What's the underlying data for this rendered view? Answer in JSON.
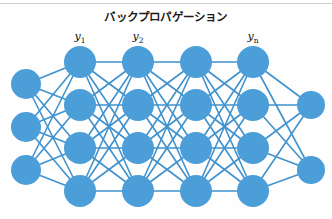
{
  "figure": {
    "title": "バックプロパゲーション",
    "background_color": "#fefefe",
    "rule_color": "#cfcfcf"
  },
  "colors": {
    "node_fill": "#4b9ed8",
    "node_fill_light": "#5aa9de",
    "edge": "#3f92ce",
    "text": "#111111"
  },
  "labels": [
    {
      "id": "y1",
      "base": "y",
      "sub": "1",
      "x": 80,
      "y": 30
    },
    {
      "id": "y2",
      "base": "y",
      "sub": "2",
      "x": 138,
      "y": 30
    },
    {
      "id": "yn",
      "base": "y",
      "sub": "n",
      "x": 253,
      "y": 30
    }
  ],
  "chart_data": {
    "type": "diagram",
    "title": "バックプロパゲーション",
    "diagram_kind": "neural-network",
    "layer_count": 6,
    "layers": [
      {
        "name": "input-layer",
        "node_count": 3,
        "x": 26,
        "node_radius": 15,
        "node_y": [
          84,
          127,
          170
        ]
      },
      {
        "name": "hidden-layer-1",
        "node_count": 4,
        "x": 80,
        "node_radius": 16,
        "node_y": [
          62,
          105,
          148,
          191
        ],
        "label": "y1"
      },
      {
        "name": "hidden-layer-2",
        "node_count": 4,
        "x": 138,
        "node_radius": 16,
        "node_y": [
          62,
          105,
          148,
          191
        ],
        "label": "y2"
      },
      {
        "name": "hidden-layer-3",
        "node_count": 4,
        "x": 196,
        "node_radius": 16,
        "node_y": [
          62,
          105,
          148,
          191
        ]
      },
      {
        "name": "hidden-layer-4",
        "node_count": 4,
        "x": 253,
        "node_radius": 16,
        "node_y": [
          62,
          105,
          148,
          191
        ],
        "label": "yn"
      },
      {
        "name": "output-layer",
        "node_count": 2,
        "x": 311,
        "node_radius": 14,
        "node_y": [
          105,
          170
        ]
      }
    ],
    "edges": "fully-connected between adjacent layers",
    "edge_width": 1.6,
    "legend": [],
    "xlabel": "",
    "ylabel": ""
  }
}
